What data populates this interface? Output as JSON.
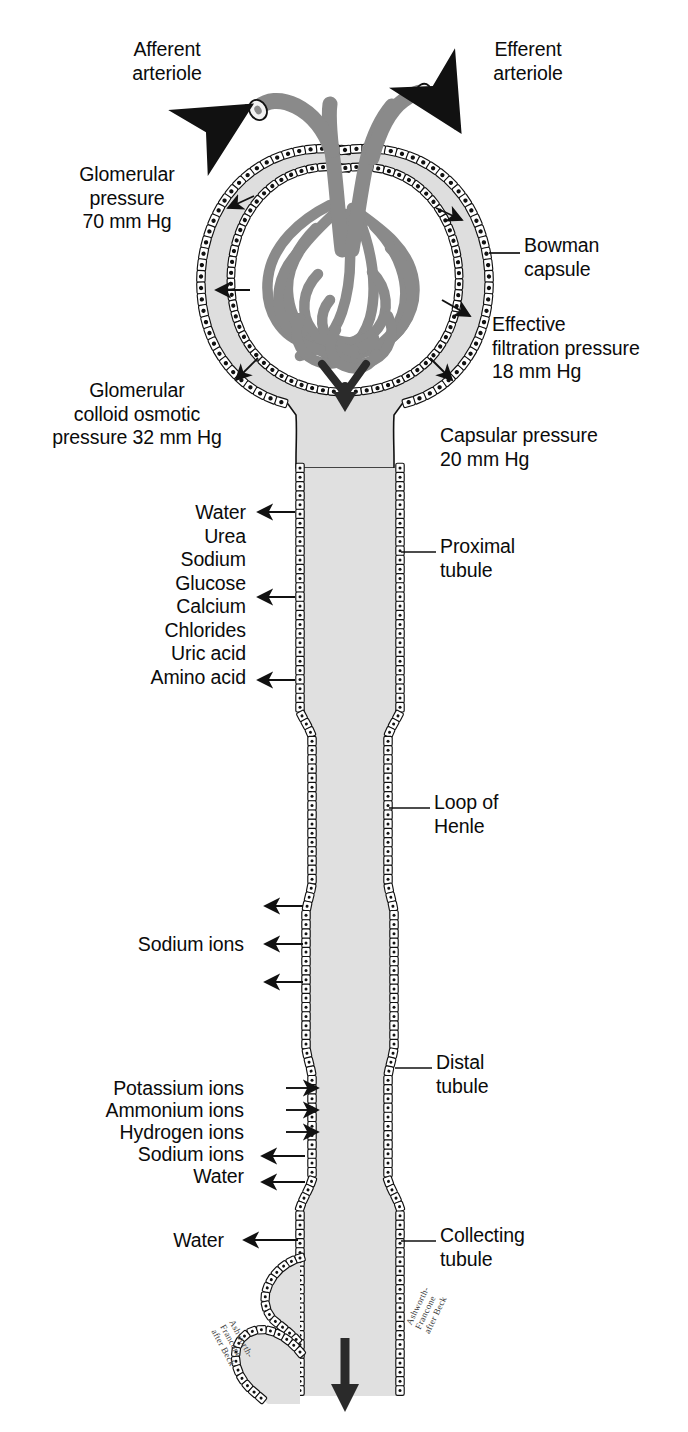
{
  "figure": {
    "colors": {
      "capillary_gray": "#8a8a8a",
      "lumen_gray": "#e0e0e0",
      "capsule_fill": "#dedede",
      "outline": "#111111",
      "text": "#0b0b0b",
      "arrow": "#111111"
    }
  },
  "labels": {
    "afferent_arteriole": "Afferent\narteriole",
    "efferent_arteriole": "Efferent\narteriole",
    "glomerular_pressure": "Glomerular\npressure\n70 mm Hg",
    "bowman_capsule": "Bowman\ncapsule",
    "effective_filtration_pressure": "Effective\nfiltration pressure\n18 mm Hg",
    "glomerular_colloid_osmotic_pressure": "Glomerular\ncolloid osmotic\npressure 32 mm Hg",
    "capsular_pressure": "Capsular pressure\n20 mm Hg",
    "proximal_tubule": "Proximal\ntubule",
    "loop_of_henle": "Loop of\nHenle",
    "distal_tubule": "Distal\ntubule",
    "collecting_tubule": "Collecting\ntubule",
    "sodium_ions_henle": "Sodium ions",
    "water_collecting": "Water"
  },
  "pressures": [
    {
      "name": "Glomerular pressure",
      "value": 70,
      "unit": "mm Hg"
    },
    {
      "name": "Glomerular colloid osmotic pressure",
      "value": 32,
      "unit": "mm Hg"
    },
    {
      "name": "Capsular pressure",
      "value": 20,
      "unit": "mm Hg"
    },
    {
      "name": "Effective filtration pressure",
      "value": 18,
      "unit": "mm Hg"
    }
  ],
  "proximal_substances": [
    "Water",
    "Urea",
    "Sodium",
    "Glucose",
    "Calcium",
    "Chlorides",
    "Uric acid",
    "Amino acid"
  ],
  "distal_substances": [
    {
      "label": "Potassium ions",
      "direction": "into-tubule"
    },
    {
      "label": "Ammonium ions",
      "direction": "into-tubule"
    },
    {
      "label": "Hydrogen ions",
      "direction": "into-tubule"
    },
    {
      "label": "Sodium ions",
      "direction": "out-of-tubule"
    },
    {
      "label": "Water",
      "direction": "out-of-tubule"
    }
  ],
  "signatures": {
    "left": "Ashworth-\nFrancone\nafter Beck",
    "right": "Ashworth-\nFrancone\nafter Beck"
  }
}
